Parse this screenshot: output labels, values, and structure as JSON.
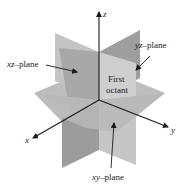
{
  "diagram": {
    "axes": {
      "z": {
        "label": "z"
      },
      "x": {
        "label": "x"
      },
      "y": {
        "label": "y"
      }
    },
    "planes": {
      "xz": {
        "label_var": "xz",
        "label_suffix": "–plane"
      },
      "yz": {
        "label_var": "yz",
        "label_suffix": "–plane"
      },
      "xy": {
        "label_var": "xy",
        "label_suffix": "–plane"
      }
    },
    "region": {
      "line1": "First",
      "line2": "octant"
    },
    "colors": {
      "background": "#ffffff",
      "axis": "#1a1a1a",
      "plane_light": "#c8c8c8",
      "plane_mid": "#b3b3b3",
      "plane_dark": "#9a9a9a",
      "plane_front": "#bdbdbd"
    }
  }
}
